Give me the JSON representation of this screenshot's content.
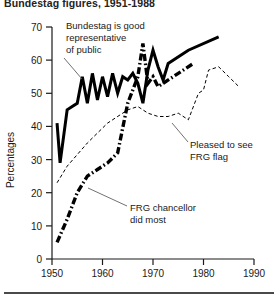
{
  "figure": {
    "title": "Bundestag figures, 1951-1988",
    "bottom_rule": true
  },
  "axes": {
    "y_title": "Percentages",
    "y_ticks": [
      "0",
      "10",
      "20",
      "30",
      "40",
      "50",
      "60",
      "70"
    ],
    "x_ticks": [
      "1950",
      "1960",
      "1970",
      "1980",
      "1990"
    ]
  },
  "annotations": {
    "bundestag": {
      "line1": "Bundestag is good",
      "line2": "representative",
      "line3": "of public"
    },
    "flag": {
      "line1": "Pleased to see",
      "line2": "FRG flag"
    },
    "chancellor": {
      "line1": "FRG chancellor",
      "line2": "did most"
    }
  },
  "chart_data": {
    "type": "line",
    "title": "Bundestag figures, 1951-1988",
    "xlabel": "",
    "ylabel": "Percentages",
    "xlim": [
      1950,
      1990
    ],
    "ylim": [
      0,
      70
    ],
    "grid": false,
    "legend": "annotated-inline",
    "yticks": [
      0,
      10,
      20,
      30,
      40,
      50,
      60,
      70
    ],
    "xticks": [
      1950,
      1960,
      1970,
      1980,
      1990
    ],
    "series": [
      {
        "name": "Bundestag is good representative of public",
        "style": "solid-thick",
        "color": "#000000",
        "points": [
          [
            1951,
            41
          ],
          [
            1951.6,
            29
          ],
          [
            1953,
            45
          ],
          [
            1954,
            46
          ],
          [
            1955,
            47
          ],
          [
            1956,
            55
          ],
          [
            1957,
            47
          ],
          [
            1958,
            56
          ],
          [
            1959,
            48
          ],
          [
            1960,
            55
          ],
          [
            1961,
            49
          ],
          [
            1962,
            56
          ],
          [
            1963,
            50
          ],
          [
            1964,
            55
          ],
          [
            1965,
            54
          ],
          [
            1966,
            56
          ],
          [
            1967,
            53
          ],
          [
            1968,
            47
          ],
          [
            1969,
            57
          ],
          [
            1970,
            63
          ],
          [
            1971,
            58
          ],
          [
            1972,
            54
          ],
          [
            1973,
            59
          ],
          [
            1977,
            63
          ],
          [
            1983,
            67
          ]
        ]
      },
      {
        "name": "Pleased to see FRG flag",
        "style": "dashed-thin",
        "color": "#000000",
        "points": [
          [
            1951,
            23
          ],
          [
            1953,
            28
          ],
          [
            1957,
            35
          ],
          [
            1961,
            41
          ],
          [
            1965,
            45
          ],
          [
            1967,
            46
          ],
          [
            1969,
            44
          ],
          [
            1971,
            43
          ],
          [
            1973,
            43
          ],
          [
            1975,
            44
          ],
          [
            1977,
            42
          ],
          [
            1979,
            50
          ],
          [
            1980,
            51
          ],
          [
            1981,
            57
          ],
          [
            1983,
            58
          ],
          [
            1985,
            55
          ],
          [
            1987,
            52
          ]
        ]
      },
      {
        "name": "FRG chancellor did most",
        "style": "dashdot-thick",
        "color": "#000000",
        "points": [
          [
            1951,
            5
          ],
          [
            1953,
            12
          ],
          [
            1955,
            20
          ],
          [
            1957,
            25
          ],
          [
            1959,
            27
          ],
          [
            1961,
            29
          ],
          [
            1963,
            32
          ],
          [
            1965,
            47
          ],
          [
            1967,
            55
          ],
          [
            1968,
            65
          ],
          [
            1969,
            53
          ],
          [
            1970,
            55
          ],
          [
            1971,
            52
          ],
          [
            1972,
            53
          ],
          [
            1975,
            56
          ],
          [
            1978,
            59
          ]
        ]
      }
    ]
  }
}
